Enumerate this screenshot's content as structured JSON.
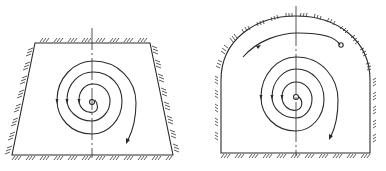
{
  "figures": [
    {
      "id": "trapezoid",
      "shape": "trapezoidal tunnel section",
      "description": "Spiral path starting at center, expanding outward clockwise with direction arrows",
      "has_hatching": true,
      "spiral_turns": 3,
      "start_marker": "small circle at center"
    },
    {
      "id": "arch",
      "shape": "arched (vaulted) tunnel section",
      "description": "Spiral path from center outward, ending at a small circle near the top right",
      "has_hatching": true,
      "spiral_turns": 4,
      "start_marker": "small circle at center",
      "end_marker": "small circle near crown"
    }
  ],
  "colors": {
    "line": "#2a2a2a",
    "background": "#ffffff"
  }
}
